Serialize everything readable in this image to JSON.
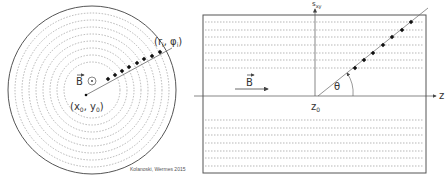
{
  "left_panel": {
    "title": "transverse view",
    "field_label": "B",
    "field_symbol": "⊙",
    "origin_label": {
      "open": "(x",
      "sub0": "0",
      "comma": ", y",
      "sub1": "0",
      "close": ")"
    },
    "hit_label": {
      "open": "(r",
      "sub0": "i",
      "comma": ", φ",
      "sub1": "i",
      "close": ")"
    },
    "outer_circle": {
      "cx": 92,
      "cy": 90,
      "r": 84
    },
    "ring_radii": [
      77,
      70,
      63,
      56,
      49,
      42,
      35,
      28
    ],
    "track": {
      "x1": 86,
      "y1": 95,
      "x2": 172,
      "y2": 48
    },
    "hits": [
      [
        108,
        79
      ],
      [
        115,
        75
      ],
      [
        122,
        71
      ],
      [
        129,
        67
      ],
      [
        137,
        63
      ],
      [
        144,
        59
      ],
      [
        152,
        56
      ],
      [
        160,
        52
      ]
    ]
  },
  "right_panel": {
    "title": "longitudinal view",
    "field_label": "B",
    "z_axis_label": "z",
    "s_axis_label": {
      "main": "s",
      "sub": "xy"
    },
    "z0_label": {
      "main": "z",
      "sub": "0"
    },
    "angle_label": "θ",
    "rect": {
      "x": 203,
      "y": 15,
      "w": 223,
      "h": 158
    },
    "dashed_upper_y": [
      22,
      30,
      37,
      45,
      53,
      60,
      68
    ],
    "dashed_lower_y": [
      120,
      128,
      135,
      143,
      151,
      158,
      166
    ],
    "track": {
      "x1": 318,
      "y1": 96,
      "x2": 428,
      "y2": 8
    },
    "hits": [
      [
        355,
        68
      ],
      [
        364,
        60
      ],
      [
        373,
        53
      ],
      [
        383,
        45
      ],
      [
        392,
        37
      ],
      [
        402,
        30
      ],
      [
        411,
        22
      ]
    ]
  },
  "credit": "Kolanoski, Wermes 2015",
  "colors": {
    "line": "#555555",
    "dash": "#888888",
    "dot": "#111111"
  }
}
